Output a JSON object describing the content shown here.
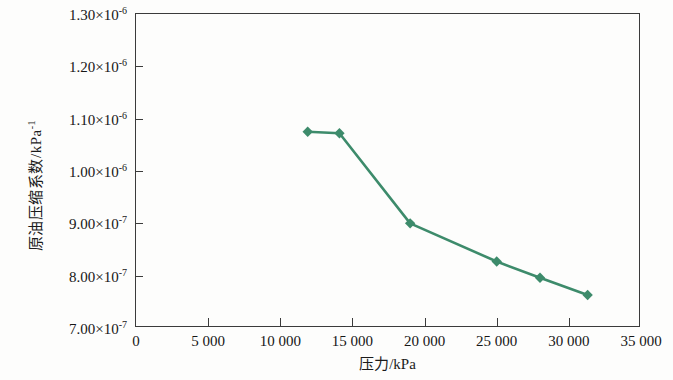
{
  "chart_data": {
    "type": "line",
    "title": "",
    "xlabel": "压力/kPa",
    "ylabel": "原油压缩系数/kPa⁻¹",
    "ylabel_base": "原油压缩系数/kPa",
    "ylabel_exponent": "-1",
    "xlim": [
      0,
      35000
    ],
    "ylim": [
      7e-07,
      1.3e-06
    ],
    "grid": false,
    "legend": null,
    "line_color": "#3d8b6b",
    "marker": "diamond",
    "marker_color": "#3d8b6b",
    "x_tick_labels": [
      "0",
      "5 000",
      "10 000",
      "15 000",
      "20 000",
      "25 000",
      "30 000",
      "35 000"
    ],
    "x_tick_values": [
      0,
      5000,
      10000,
      15000,
      20000,
      25000,
      30000,
      35000
    ],
    "y_tick_values": [
      7e-07,
      8e-07,
      9e-07,
      1e-06,
      1.1e-06,
      1.2e-06,
      1.3e-06
    ],
    "y_tick_labels": [
      {
        "mantissa": "7.00",
        "exponent": "-7"
      },
      {
        "mantissa": "8.00",
        "exponent": "-7"
      },
      {
        "mantissa": "9.00",
        "exponent": "-7"
      },
      {
        "mantissa": "1.00",
        "exponent": "-6"
      },
      {
        "mantissa": "1.10",
        "exponent": "-6"
      },
      {
        "mantissa": "1.20",
        "exponent": "-6"
      },
      {
        "mantissa": "1.30",
        "exponent": "-6"
      }
    ],
    "series": [
      {
        "name": "原油压缩系数",
        "x": [
          11900,
          14100,
          19000,
          25000,
          28000,
          31300
        ],
        "y": [
          1.075e-06,
          1.072e-06,
          9e-07,
          8.27e-07,
          7.96e-07,
          7.63e-07
        ]
      }
    ]
  }
}
